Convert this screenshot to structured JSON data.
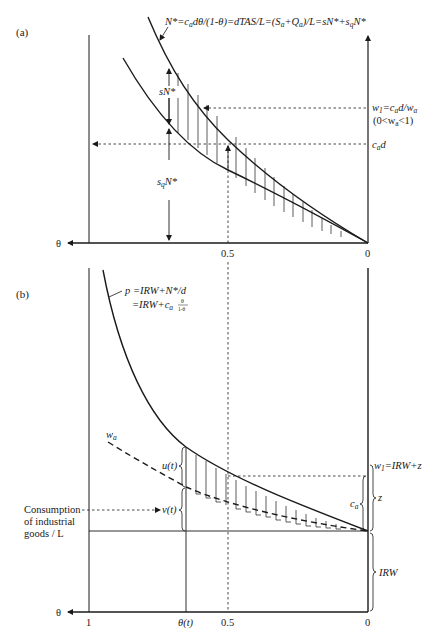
{
  "figure": {
    "panel_a": {
      "label": "(a)",
      "curve_label": "N*=cₐdθ/(1-θ)=dTAS/L=(Sₐ+Qₐ)/L=sN*+s_qN*",
      "curve_label_parts": {
        "p1": "N*=c",
        "p1_sub": "a",
        "p2": "dθ/(1-θ)=dTAS/L=(S",
        "p2_sub": "a",
        "p3": "+Q",
        "p3_sub": "a",
        "p4": ")/L=sN*+s",
        "p4_sub": "q",
        "p5": "N*"
      },
      "sN_label": "sN*",
      "sqN_label": {
        "s": "s",
        "sub": "q",
        "rest": "N*"
      },
      "w1_label": {
        "w": "w",
        "sub": "1",
        "eq": "=c",
        "sub2": "a",
        "rest": "d/w",
        "sub3": "a"
      },
      "w1_condition": {
        "open": "(0<w",
        "sub": "a",
        "close": "<1)"
      },
      "cad_label": {
        "c": "c",
        "sub": "a",
        "d": "d"
      },
      "x_axis_symbol": "θ",
      "ticks": [
        "0.5",
        "0"
      ]
    },
    "panel_b": {
      "label": "(b)",
      "p_eq_line1": "p =IRW+N*/d",
      "p_eq_line2": {
        "pre": "=IRW+c",
        "sub": "a",
        "num": "θ",
        "den": "1-θ"
      },
      "wa_label": {
        "w": "w",
        "sub": "a"
      },
      "u_label": "u(t)",
      "v_label": "v(t)",
      "consumption_label": [
        "Consumption",
        "of industrial",
        "goods / L"
      ],
      "w1_label": {
        "w": "w",
        "sub": "1",
        "rest": "=IRW+z"
      },
      "ca_label": {
        "c": "c",
        "sub": "a"
      },
      "z_label": "z",
      "irw_label": "IRW",
      "x_axis_symbol": "θ",
      "ticks": [
        "1",
        "θ(t)",
        "0.5",
        "0"
      ]
    }
  }
}
